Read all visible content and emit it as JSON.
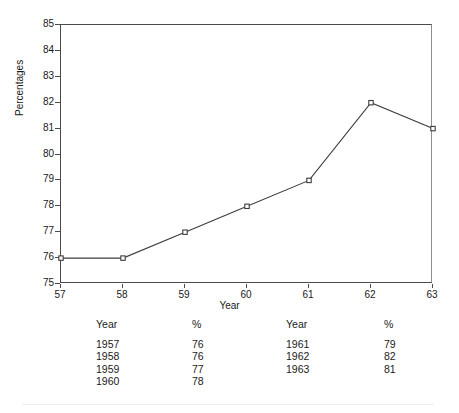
{
  "chart_data": {
    "type": "line",
    "title": "",
    "xlabel": "Year",
    "ylabel": "Percentages",
    "x": [
      57,
      58,
      59,
      60,
      61,
      62,
      63
    ],
    "values": [
      76,
      76,
      77,
      78,
      79,
      82,
      81
    ],
    "categories": [
      "57",
      "58",
      "59",
      "60",
      "61",
      "62",
      "63"
    ],
    "xtick_labels": [
      "57",
      "58",
      "59",
      "60",
      "61",
      "62",
      "63"
    ],
    "ytick_labels": [
      "85",
      "84",
      "83",
      "82",
      "81",
      "80",
      "79",
      "78",
      "77",
      "76",
      "75"
    ],
    "ylim": [
      75,
      85
    ],
    "xlim": [
      57,
      63
    ],
    "grid": false,
    "legend": "none",
    "marker": "open-square",
    "line_color": "#3d3d3d",
    "marker_color": "#3d3d3d",
    "axis_color": "#4a4a4a",
    "series": [
      {
        "name": "Percentages",
        "values": [
          76,
          76,
          77,
          78,
          79,
          82,
          81
        ]
      }
    ],
    "points": [
      {
        "x": 57,
        "y": 76
      },
      {
        "x": 58,
        "y": 76
      },
      {
        "x": 59,
        "y": 77
      },
      {
        "x": 60,
        "y": 78
      },
      {
        "x": 61,
        "y": 79
      },
      {
        "x": 62,
        "y": 82
      },
      {
        "x": 63,
        "y": 81
      }
    ]
  },
  "table": {
    "headers": [
      "Year",
      "%",
      "Year",
      "%"
    ],
    "rows": [
      {
        "year_a": "1957",
        "pct_a": "76",
        "year_b": "1961",
        "pct_b": "79"
      },
      {
        "year_a": "1958",
        "pct_a": "76",
        "year_b": "1962",
        "pct_b": "82"
      },
      {
        "year_a": "1959",
        "pct_a": "77",
        "year_b": "1963",
        "pct_b": "81"
      },
      {
        "year_a": "1960",
        "pct_a": "78",
        "year_b": "",
        "pct_b": ""
      }
    ]
  }
}
